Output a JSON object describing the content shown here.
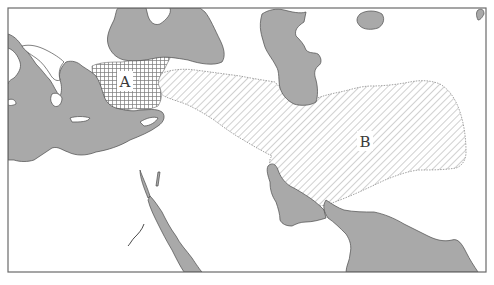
{
  "map": {
    "type": "historical-region-map",
    "colors": {
      "sea": "#a9a9a9",
      "land": "#ffffff",
      "coast": "#4a4a4a",
      "hatch": "#7a7a7a",
      "frame": "#6a6a6a",
      "label": "#3a3a3a"
    },
    "regions": [
      {
        "id": "A",
        "label": "A",
        "pattern": "crosshatch-grid",
        "area": "western Anatolia"
      },
      {
        "id": "B",
        "label": "B",
        "pattern": "diagonal-hatch",
        "area": "eastern Anatolia to Iranian plateau"
      }
    ],
    "water_bodies": [
      "Mediterranean Sea",
      "Black Sea",
      "Caspian Sea",
      "Aral Sea",
      "Red Sea",
      "Persian Gulf",
      "Arabian Sea"
    ]
  }
}
